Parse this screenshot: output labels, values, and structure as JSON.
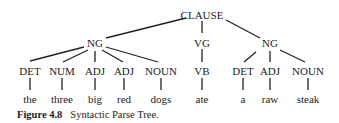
{
  "tree": {
    "root": "CLAUSE",
    "phrases": [
      "NG",
      "VG",
      "NG"
    ],
    "pos": [
      "DET",
      "NUM",
      "ADJ",
      "ADJ",
      "NOUN",
      "VB",
      "DET",
      "ADJ",
      "NOUN"
    ],
    "words": [
      "the",
      "three",
      "big",
      "red",
      "dogs",
      "ate",
      "a",
      "raw",
      "steak"
    ]
  },
  "caption": {
    "figure": "Figure 4.8",
    "title": "Syntactic Parse Tree."
  }
}
